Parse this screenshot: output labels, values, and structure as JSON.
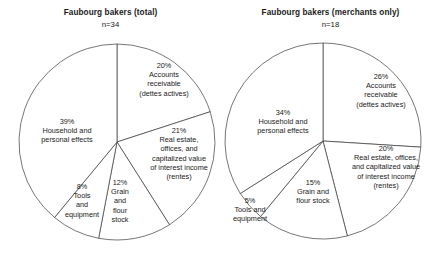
{
  "chart_data": [
    {
      "type": "pie",
      "title": "Faubourg bakers (total)",
      "subtitle": "n=34",
      "n": 34,
      "categories": [
        "Accounts receivable (dettes actives)",
        "Real estate, offices, and capitalized value of interest income (rentes)",
        "Grain and flour stock",
        "Tools and equipment",
        "Household and personal effects"
      ],
      "values": [
        20,
        21,
        12,
        8,
        39
      ],
      "units": "percent",
      "legend": "none",
      "slices": [
        {
          "pct": "20%",
          "label": "Accounts\nreceivable\n(dettes actives)"
        },
        {
          "pct": "21%",
          "label": "Real estate,\noffices, and\ncapitalized value\nof interest income\n(rentes)"
        },
        {
          "pct": "12%",
          "label": "Grain\nand\nflour\nstock"
        },
        {
          "pct": "8%",
          "label": "Tools\nand\nequipment"
        },
        {
          "pct": "39%",
          "label": "Household and\npersonal effects"
        }
      ]
    },
    {
      "type": "pie",
      "title": "Faubourg bakers (merchants only)",
      "subtitle": "n=18",
      "n": 18,
      "categories": [
        "Accounts receivable (dettes actives)",
        "Real estate, offices, and capitalized value of interest income (rentes)",
        "Grain and flour stock",
        "Tools and equipment",
        "Household and personal effects"
      ],
      "values": [
        26,
        20,
        15,
        5,
        34
      ],
      "units": "percent",
      "legend": "none",
      "slices": [
        {
          "pct": "26%",
          "label": "Accounts\nreceivable\n(dettes actives)"
        },
        {
          "pct": "20%",
          "label": "Real estate, offices,\nand capitalized value\nof interest income\n(rentes)"
        },
        {
          "pct": "15%",
          "label": "Grain and\nflour stock"
        },
        {
          "pct": "5%",
          "label": "Tools and\nequipment"
        },
        {
          "pct": "34%",
          "label": "Household and\npersonal effects"
        }
      ]
    }
  ],
  "style": {
    "stroke": "#3b3b3b",
    "fill": "#ffffff",
    "text": "#1a1a1a",
    "background": "#ffffff"
  },
  "geometry": {
    "left": {
      "cx": 117,
      "cy": 142,
      "r": 98
    },
    "right": {
      "cx": 103,
      "cy": 141,
      "r": 98
    }
  },
  "label_positions": {
    "left": [
      {
        "left": 126,
        "top": 61,
        "width": 76
      },
      {
        "left": 140,
        "top": 126,
        "width": 78
      },
      {
        "left": 104,
        "top": 178,
        "width": 32
      },
      {
        "left": 60,
        "top": 182,
        "width": 44
      },
      {
        "left": 26,
        "top": 117,
        "width": 82
      }
    ],
    "right": [
      {
        "left": 120,
        "top": 72,
        "width": 82
      },
      {
        "left": 120,
        "top": 144,
        "width": 92
      },
      {
        "left": 62,
        "top": 178,
        "width": 62
      },
      {
        "left": 2,
        "top": 196,
        "width": 56
      },
      {
        "left": 20,
        "top": 108,
        "width": 86
      }
    ]
  }
}
